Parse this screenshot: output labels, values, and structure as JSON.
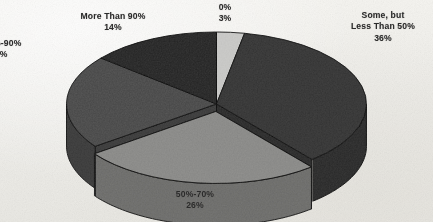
{
  "chart_data": {
    "type": "pie",
    "title": "",
    "subtitle": "",
    "xlabel": "",
    "ylabel": "",
    "legend_position": "none",
    "grid": false,
    "three_d": true,
    "start_angle_deg": 0,
    "direction": "clockwise",
    "units": "percent",
    "total": 100,
    "categories": [
      "0%",
      "Some, but Less Than 50%",
      "50%-70%",
      "70%-90%",
      "More Than 90%"
    ],
    "values": [
      3,
      36,
      26,
      21,
      14
    ],
    "slices": [
      {
        "label": "0%",
        "label_line1": "0%",
        "label_line2": "",
        "value": 3,
        "value_text": "3%",
        "color": "#c9c9c7",
        "side_color": "#a9a9a6",
        "exploded": false,
        "label_clipped": false
      },
      {
        "label": "Some, but Less Than 50%",
        "label_line1": "Some, but",
        "label_line2": "Less Than 50%",
        "value": 36,
        "value_text": "36%",
        "color": "#353535",
        "side_color": "#2a2a2a",
        "exploded": false,
        "label_clipped": false
      },
      {
        "label": "50%-70%",
        "label_line1": "50%-70%",
        "label_line2": "",
        "value": 26,
        "value_text": "26%",
        "color": "#8b8b89",
        "side_color": "#6e6e6c",
        "exploded": true,
        "label_clipped": false
      },
      {
        "label": "70%-90%",
        "label_line1": ")%-90%",
        "label_line2": "",
        "value": 21,
        "value_text": "21%",
        "color": "#4b4b4b",
        "side_color": "#3b3b3b",
        "exploded": false,
        "label_clipped": true
      },
      {
        "label": "More Than 90%",
        "label_line1": "More Than 90%",
        "label_line2": "",
        "value": 14,
        "value_text": "14%",
        "color": "#272727",
        "side_color": "#1d1d1d",
        "exploded": false,
        "label_clipped": false
      }
    ]
  },
  "canvas": {
    "background": "#f2f1ed",
    "text_color": "#2b2b2b",
    "outline_color": "#111111"
  }
}
